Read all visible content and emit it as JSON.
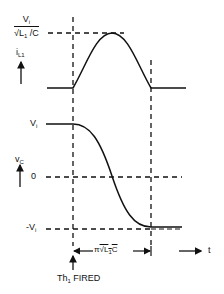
{
  "diagram": {
    "current_plot": {
      "axis_label": "i",
      "axis_label_sub": "L1",
      "peak_label_num": "V",
      "peak_label_num_sub": "i",
      "peak_label_den": "√L",
      "peak_label_den_sub": "1",
      "peak_label_den_tail": " /C"
    },
    "voltage_plot": {
      "axis_label": "v",
      "axis_label_sub": "C",
      "level_high": "V",
      "level_high_sub": "i",
      "level_zero": "0",
      "level_low": "-V",
      "level_low_sub": "i"
    },
    "time_axis": {
      "interval_label_pi": "π",
      "interval_label_root": "√L",
      "interval_label_root_sub": "1",
      "interval_label_tail": "C",
      "time_label": "t"
    },
    "event": {
      "label": "Th",
      "label_sub": "1",
      "label_tail": " FIRED"
    },
    "colors": {
      "ink": "#111111",
      "background": "#ffffff"
    }
  }
}
